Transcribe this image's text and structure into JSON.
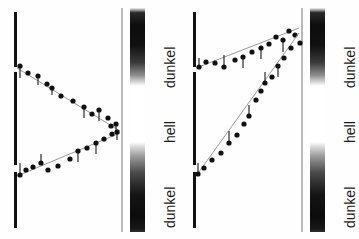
{
  "figure": {
    "background_color": "#fefefe",
    "ink_color": "#121212",
    "reference_line_color": "#b9b9b9",
    "width": 359,
    "height": 239
  },
  "scale_labels": {
    "dark_top": "dunkel",
    "light_middle": "hell",
    "dark_bottom": "dunkel"
  },
  "panels": [
    {
      "id": "panel-left",
      "name": "left-panel",
      "axis_segments": [
        {
          "name": "axis-segment-top",
          "x": 14,
          "y": 12,
          "height": 55
        },
        {
          "name": "axis-segment-middle",
          "x": 14,
          "y": 72,
          "height": 93
        },
        {
          "name": "axis-segment-bottom",
          "x": 14,
          "y": 172,
          "height": 56
        }
      ],
      "reference_line": {
        "x": 121,
        "y": 8,
        "height": 224
      },
      "scale_bar": {
        "x": 130,
        "y": 8,
        "height": 224,
        "dark_top_height": 78,
        "light_height": 56,
        "dark_bottom_height": 90
      },
      "label_positions": {
        "dark_top_y": 88,
        "light_y": 143,
        "dark_bottom_y": 228
      },
      "label_x": 162
    },
    {
      "id": "panel-right",
      "name": "right-panel",
      "axis_segments": [
        {
          "name": "axis-segment-top",
          "x": 14,
          "y": 12,
          "height": 55
        },
        {
          "name": "axis-segment-middle",
          "x": 14,
          "y": 72,
          "height": 93
        },
        {
          "name": "axis-segment-bottom",
          "x": 14,
          "y": 172,
          "height": 56
        }
      ],
      "reference_line": {
        "x": 122,
        "y": 8,
        "height": 224
      },
      "scale_bar": {
        "x": 131,
        "y": 8,
        "height": 224,
        "dark_top_height": 78,
        "light_height": 56,
        "dark_bottom_height": 90
      },
      "label_positions": {
        "dark_top_y": 88,
        "light_y": 143,
        "dark_bottom_y": 228
      },
      "label_x": 163
    }
  ],
  "chart_data": {
    "type": "scatter",
    "xlabel": "",
    "ylabel": "",
    "grid": false,
    "legend": null,
    "axis_ranges": {
      "x": [
        14,
        122
      ],
      "y": [
        8,
        232
      ]
    },
    "scale_zones": [
      {
        "label": "dunkel",
        "y_from": 8,
        "y_to": 86
      },
      {
        "label": "hell",
        "y_from": 86,
        "y_to": 142
      },
      {
        "label": "dunkel",
        "y_from": 142,
        "y_to": 232
      }
    ],
    "charts": [
      {
        "panel": "left-panel",
        "description": "Zwei Spuren divergieren von links nach rechts zur Mitte konvergierend",
        "series": [
          {
            "name": "upper-branch",
            "guide_line": [
              [
                17,
                68
              ],
              [
                120,
                131
              ]
            ],
            "points": [
              {
                "x": 20,
                "y": 66,
                "err_y": 78
              },
              {
                "x": 28,
                "y": 73,
                "err_y": 73
              },
              {
                "x": 38,
                "y": 76,
                "err_y": 85
              },
              {
                "x": 47,
                "y": 84,
                "err_y": 84
              },
              {
                "x": 52,
                "y": 88,
                "err_y": 95
              },
              {
                "x": 61,
                "y": 96,
                "err_y": 96
              },
              {
                "x": 73,
                "y": 101,
                "err_y": 101
              },
              {
                "x": 84,
                "y": 107,
                "err_y": 118
              },
              {
                "x": 92,
                "y": 114,
                "err_y": 114
              },
              {
                "x": 99,
                "y": 110,
                "err_y": 121
              },
              {
                "x": 108,
                "y": 118,
                "err_y": 118
              },
              {
                "x": 111,
                "y": 126,
                "err_y": 126
              },
              {
                "x": 116,
                "y": 124,
                "err_y": 133
              }
            ]
          },
          {
            "name": "lower-branch",
            "guide_line": [
              [
                17,
                176
              ],
              [
                120,
                133
              ]
            ],
            "points": [
              {
                "x": 20,
                "y": 175,
                "err_y": 163
              },
              {
                "x": 26,
                "y": 170,
                "err_y": 170
              },
              {
                "x": 33,
                "y": 167,
                "err_y": 167
              },
              {
                "x": 41,
                "y": 163,
                "err_y": 154
              },
              {
                "x": 48,
                "y": 170,
                "err_y": 170
              },
              {
                "x": 58,
                "y": 166,
                "err_y": 166
              },
              {
                "x": 70,
                "y": 159,
                "err_y": 159
              },
              {
                "x": 78,
                "y": 151,
                "err_y": 162
              },
              {
                "x": 87,
                "y": 148,
                "err_y": 148
              },
              {
                "x": 96,
                "y": 143,
                "err_y": 154
              },
              {
                "x": 104,
                "y": 139,
                "err_y": 139
              },
              {
                "x": 112,
                "y": 134,
                "err_y": 134
              },
              {
                "x": 117,
                "y": 132,
                "err_y": 140
              }
            ]
          }
        ]
      },
      {
        "panel": "right-panel",
        "description": "Zwei aufsteigende Spuren, beide von links unten nach rechts oben",
        "series": [
          {
            "name": "upper-branch",
            "guide_line": [
              [
                17,
                68
              ],
              [
                120,
                28
              ]
            ],
            "points": [
              {
                "x": 20,
                "y": 67,
                "err_y": 58
              },
              {
                "x": 27,
                "y": 62,
                "err_y": 62
              },
              {
                "x": 36,
                "y": 63,
                "err_y": 63
              },
              {
                "x": 45,
                "y": 67,
                "err_y": 55
              },
              {
                "x": 56,
                "y": 60,
                "err_y": 60
              },
              {
                "x": 64,
                "y": 57,
                "err_y": 68
              },
              {
                "x": 73,
                "y": 52,
                "err_y": 52
              },
              {
                "x": 82,
                "y": 48,
                "err_y": 59
              },
              {
                "x": 90,
                "y": 44,
                "err_y": 44
              },
              {
                "x": 97,
                "y": 37,
                "err_y": 37
              },
              {
                "x": 104,
                "y": 40,
                "err_y": 52
              },
              {
                "x": 110,
                "y": 31,
                "err_y": 31
              },
              {
                "x": 116,
                "y": 35,
                "err_y": 35
              },
              {
                "x": 121,
                "y": 43,
                "err_y": 43
              }
            ]
          },
          {
            "name": "lower-branch",
            "guide_line": [
              [
                17,
                176
              ],
              [
                120,
                33
              ]
            ],
            "points": [
              {
                "x": 19,
                "y": 174,
                "err_y": 163
              },
              {
                "x": 25,
                "y": 168,
                "err_y": 168
              },
              {
                "x": 33,
                "y": 160,
                "err_y": 160
              },
              {
                "x": 42,
                "y": 153,
                "err_y": 153
              },
              {
                "x": 50,
                "y": 143,
                "err_y": 131
              },
              {
                "x": 58,
                "y": 135,
                "err_y": 135
              },
              {
                "x": 65,
                "y": 124,
                "err_y": 124
              },
              {
                "x": 70,
                "y": 116,
                "err_y": 105
              },
              {
                "x": 77,
                "y": 100,
                "err_y": 100
              },
              {
                "x": 82,
                "y": 91,
                "err_y": 91
              },
              {
                "x": 86,
                "y": 83,
                "err_y": 72
              },
              {
                "x": 93,
                "y": 77,
                "err_y": 77
              },
              {
                "x": 99,
                "y": 66,
                "err_y": 77
              },
              {
                "x": 105,
                "y": 58,
                "err_y": 58
              },
              {
                "x": 112,
                "y": 48,
                "err_y": 48
              }
            ]
          }
        ]
      }
    ]
  }
}
